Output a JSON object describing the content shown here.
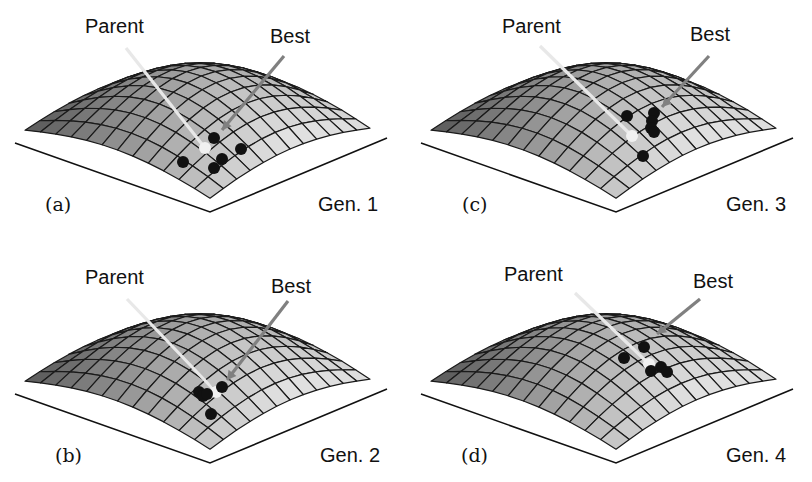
{
  "figure": {
    "colors": {
      "surface_light": "#e4e4e4",
      "surface_dark": "#5a5a5a",
      "grid": "#1a1a1a",
      "parent_arrow": "#e8e8e8",
      "best_arrow": "#808080",
      "offspring": "#111111",
      "parent_marker": "#f0f0f0"
    },
    "panels": [
      {
        "id": "a",
        "letter": "(a)",
        "generation": "Gen. 1",
        "parent_label": "Parent",
        "best_label": "Best",
        "parent": {
          "x": 205,
          "y": 148
        },
        "parent_label_pos": {
          "x": 85,
          "y": 15
        },
        "parent_arrow_from": {
          "x": 126,
          "y": 48
        },
        "best_label_pos": {
          "x": 270,
          "y": 25
        },
        "best_arrow_from": {
          "x": 284,
          "y": 56
        },
        "best_arrow_to": {
          "x": 222,
          "y": 130
        },
        "offspring": [
          [
            214,
            138
          ],
          [
            183,
            162
          ],
          [
            222,
            159
          ],
          [
            214,
            168
          ],
          [
            241,
            149
          ]
        ]
      },
      {
        "id": "c",
        "letter": "(c)",
        "generation": "Gen. 3",
        "parent_label": "Parent",
        "best_label": "Best",
        "parent": {
          "x": 226,
          "y": 136
        },
        "parent_label_pos": {
          "x": 96,
          "y": 15
        },
        "parent_arrow_from": {
          "x": 134,
          "y": 46
        },
        "best_label_pos": {
          "x": 284,
          "y": 23
        },
        "best_arrow_from": {
          "x": 303,
          "y": 56
        },
        "best_arrow_to": {
          "x": 256,
          "y": 107
        },
        "offspring": [
          [
            221,
            116
          ],
          [
            248,
            113
          ],
          [
            246,
            121
          ],
          [
            245,
            128
          ],
          [
            248,
            132
          ],
          [
            237,
            156
          ]
        ]
      },
      {
        "id": "b",
        "letter": "(b)",
        "generation": "Gen. 2",
        "parent_label": "Parent",
        "best_label": "Best",
        "parent": {
          "x": 216,
          "y": 151
        },
        "parent_label_pos": {
          "x": 85,
          "y": 25
        },
        "parent_arrow_from": {
          "x": 127,
          "y": 58
        },
        "best_label_pos": {
          "x": 271,
          "y": 34
        },
        "best_arrow_from": {
          "x": 288,
          "y": 60
        },
        "best_arrow_to": {
          "x": 227,
          "y": 139
        },
        "offspring": [
          [
            199,
            151
          ],
          [
            203,
            155
          ],
          [
            207,
            153
          ],
          [
            222,
            146
          ],
          [
            211,
            173
          ]
        ]
      },
      {
        "id": "d",
        "letter": "(d)",
        "generation": "Gen. 4",
        "parent_label": "Parent",
        "best_label": "Best",
        "parent": {
          "x": 243,
          "y": 123
        },
        "parent_label_pos": {
          "x": 98,
          "y": 22
        },
        "parent_arrow_from": {
          "x": 169,
          "y": 52
        },
        "best_label_pos": {
          "x": 287,
          "y": 29
        },
        "best_arrow_from": {
          "x": 294,
          "y": 58
        },
        "best_arrow_to": {
          "x": 251,
          "y": 93
        },
        "offspring": [
          [
            238,
            106
          ],
          [
            218,
            117
          ],
          [
            245,
            130
          ],
          [
            255,
            126
          ],
          [
            261,
            131
          ]
        ]
      }
    ]
  }
}
